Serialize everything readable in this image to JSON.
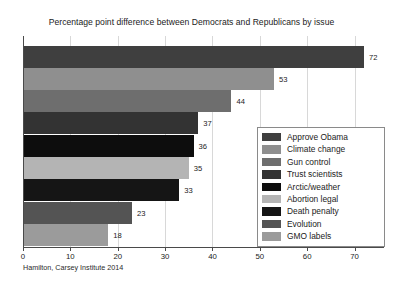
{
  "chart_data": {
    "type": "bar",
    "orientation": "horizontal",
    "title": "Percentage point difference between Democrats and Republicans by issue",
    "xlabel": "",
    "ylabel": "",
    "xlim": [
      0,
      76
    ],
    "grid": true,
    "legend_position": "lower right",
    "xticks": [
      "0",
      "10",
      "20",
      "30",
      "40",
      "50",
      "60",
      "70"
    ],
    "xtick_values": [
      0,
      10,
      20,
      30,
      40,
      50,
      60,
      70
    ],
    "categories": [
      "Approve Obama",
      "Climate change",
      "Gun control",
      "Trust scientists",
      "Arctic/weather",
      "Abortion legal",
      "Death penalty",
      "Evolution",
      "GMO labels"
    ],
    "values": [
      72,
      53,
      44,
      37,
      36,
      35,
      33,
      23,
      18
    ],
    "value_labels": [
      "72",
      "53",
      "44",
      "37",
      "36",
      "35",
      "33",
      "23",
      "18"
    ],
    "colors": [
      "#3f3f3f",
      "#8f8f8f",
      "#6e6e6e",
      "#333333",
      "#0d0d0d",
      "#b4b4b4",
      "#151515",
      "#545454",
      "#9b9b9b"
    ],
    "bars": [
      {
        "label": "Approve Obama",
        "value": 72,
        "value_label": "72",
        "color": "#3f3f3f"
      },
      {
        "label": "Climate change",
        "value": 53,
        "value_label": "53",
        "color": "#8f8f8f"
      },
      {
        "label": "Gun control",
        "value": 44,
        "value_label": "44",
        "color": "#6e6e6e"
      },
      {
        "label": "Trust scientists",
        "value": 37,
        "value_label": "37",
        "color": "#333333"
      },
      {
        "label": "Arctic/weather",
        "value": 36,
        "value_label": "36",
        "color": "#0d0d0d"
      },
      {
        "label": "Abortion legal",
        "value": 35,
        "value_label": "35",
        "color": "#b4b4b4"
      },
      {
        "label": "Death penalty",
        "value": 33,
        "value_label": "33",
        "color": "#151515"
      },
      {
        "label": "Evolution",
        "value": 23,
        "value_label": "23",
        "color": "#545454"
      },
      {
        "label": "GMO labels",
        "value": 18,
        "value_label": "18",
        "color": "#9b9b9b"
      }
    ],
    "legend": [
      {
        "label": "Approve Obama",
        "color": "#3f3f3f"
      },
      {
        "label": "Climate change",
        "color": "#8f8f8f"
      },
      {
        "label": "Gun control",
        "color": "#6e6e6e"
      },
      {
        "label": "Trust scientists",
        "color": "#333333"
      },
      {
        "label": "Arctic/weather",
        "color": "#0d0d0d"
      },
      {
        "label": "Abortion legal",
        "color": "#b4b4b4"
      },
      {
        "label": "Death penalty",
        "color": "#151515"
      },
      {
        "label": "Evolution",
        "color": "#545454"
      },
      {
        "label": "GMO labels",
        "color": "#9b9b9b"
      }
    ],
    "caption": "Hamilton, Carsey Institute 2014",
    "axis_color": "#4a4a4a",
    "grid_color": "#d8d8d8",
    "background": "#ffffff"
  }
}
